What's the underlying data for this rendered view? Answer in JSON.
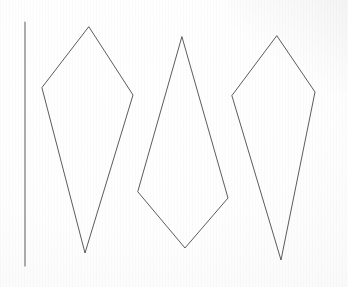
{
  "image": {
    "title": "Three hand-drawn kite quadrilaterals on paper",
    "description": "Scanned sheet of white paper showing three pencil-drawn kite shapes beside a vertical reference line",
    "width": 348,
    "height": 287,
    "background_color": "#ffffff",
    "paper_color": "#fbfbfb",
    "ink_color": "#3f3f43",
    "guide_line_color": "#55555a"
  },
  "figures": {
    "guide_line": {
      "label": "vertical reference line",
      "x1": 25,
      "y1": 22,
      "x2": 25,
      "y2": 266,
      "points": "25,22 25,266"
    },
    "shapes": [
      {
        "label": "kite-left",
        "type": "kite",
        "vertices": [
          {
            "name": "top-apex",
            "x": 89,
            "y": 27
          },
          {
            "name": "right-wing",
            "x": 133,
            "y": 95
          },
          {
            "name": "bottom-tip",
            "x": 85,
            "y": 253
          },
          {
            "name": "left-wing",
            "x": 42,
            "y": 88
          }
        ],
        "points": "89,27 133,95 85,253 42,88"
      },
      {
        "label": "kite-middle",
        "type": "kite",
        "vertices": [
          {
            "name": "top-apex",
            "x": 182,
            "y": 37
          },
          {
            "name": "right-wing",
            "x": 228,
            "y": 198
          },
          {
            "name": "bottom-tip",
            "x": 185,
            "y": 248
          },
          {
            "name": "left-wing",
            "x": 138,
            "y": 192
          }
        ],
        "points": "182,37 228,198 185,248 138,192"
      },
      {
        "label": "kite-right",
        "type": "kite",
        "vertices": [
          {
            "name": "top-apex",
            "x": 277,
            "y": 36
          },
          {
            "name": "right-wing",
            "x": 315,
            "y": 92
          },
          {
            "name": "bottom-tip",
            "x": 281,
            "y": 260
          },
          {
            "name": "left-wing",
            "x": 232,
            "y": 96
          }
        ],
        "points": "277,36 315,92 281,260 232,96"
      }
    ]
  }
}
